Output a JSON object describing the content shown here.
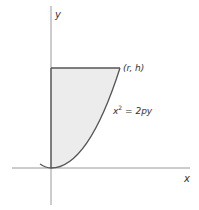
{
  "diagram": {
    "type": "coordinate-plot",
    "axes": {
      "x_label": "x",
      "y_label": "y"
    },
    "point_label": "(r, h)",
    "curve_label_base": "x",
    "curve_label_exp": "2",
    "curve_label_rest": " = 2py",
    "equation": "x^2 = 2py",
    "shaded_region": "region bounded by y-axis, line y = h, and parabola x^2 = 2py",
    "colors": {
      "line": "#555555",
      "fill": "#ececec",
      "axis": "#999999",
      "text": "#333333"
    }
  }
}
